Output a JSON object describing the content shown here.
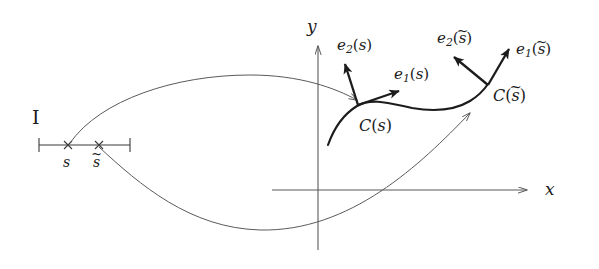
{
  "figure": {
    "type": "mathematical-diagram",
    "background_color": "#ffffff",
    "stroke_color": "#1c1c1c",
    "thin_stroke_color": "#5a5a5a",
    "width": 599,
    "height": 269
  },
  "interval": {
    "label": "I",
    "tick_labels": {
      "s": "s",
      "s_tilde_base": "s",
      "s_tilde_accent": "~"
    },
    "marks": [
      "×",
      "×"
    ]
  },
  "axes": {
    "x_label": "x",
    "y_label": "y"
  },
  "curve_points": {
    "c_of_s": {
      "C": "C",
      "open": "(",
      "arg": "s",
      "close": ")"
    },
    "c_of_s_tilde": {
      "C": "C",
      "open": "(",
      "arg": "s",
      "accent": "~",
      "close": ")"
    }
  },
  "frame_vectors": {
    "e1_s": {
      "base": "e",
      "sub": "1",
      "open": "(",
      "arg": "s",
      "close": ")"
    },
    "e2_s": {
      "base": "e",
      "sub": "2",
      "open": "(",
      "arg": "s",
      "close": ")"
    },
    "e1_s_tilde": {
      "base": "e",
      "sub": "1",
      "open": "(",
      "arg": "s",
      "accent": "~",
      "close": ")"
    },
    "e2_s_tilde": {
      "base": "e",
      "sub": "2",
      "open": "(",
      "arg": "s",
      "accent": "~",
      "close": ")"
    }
  }
}
